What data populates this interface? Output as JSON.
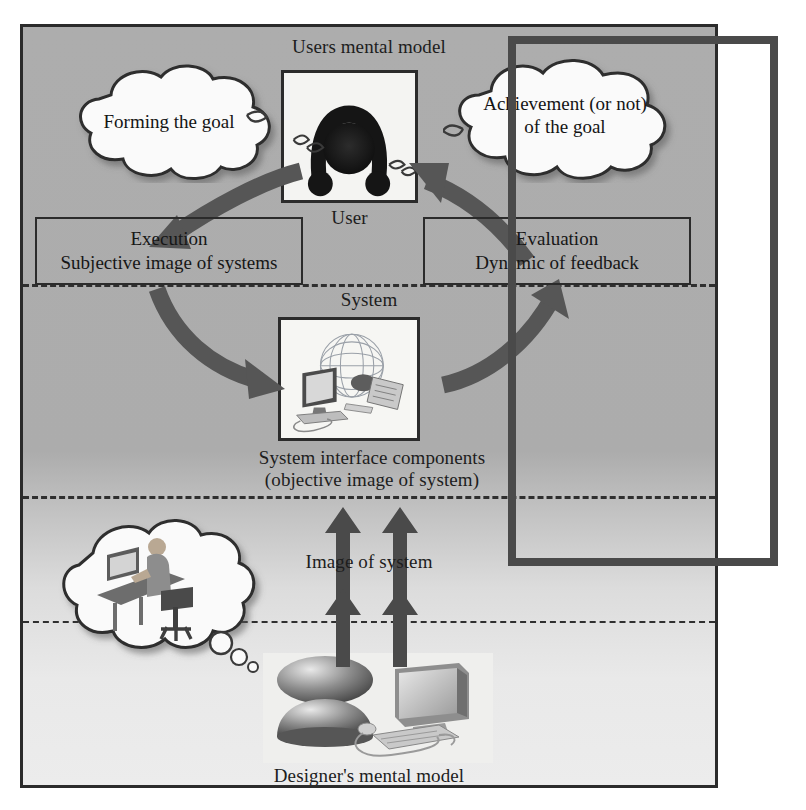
{
  "diagram": {
    "title": "Users mental model",
    "labels": {
      "users_mental_model": "Users mental model",
      "user": "User",
      "system": "System",
      "system_interface_line1": "System interface components",
      "system_interface_line2": "(objective image of system)",
      "image_of_system": "Image of system",
      "designers_mental_model": "Designer's mental model"
    },
    "clouds": [
      {
        "id": "forming-goal",
        "text": "Forming the goal"
      },
      {
        "id": "achievement-goal",
        "text": "Achievement (or not) of the goal"
      },
      {
        "id": "designer-thought",
        "text": ""
      }
    ],
    "boxes": [
      {
        "id": "execution",
        "line1": "Execution",
        "line2": "Subjective image of systems"
      },
      {
        "id": "evaluation",
        "line1": "Evaluation",
        "line2": "Dynamic of feedback"
      }
    ],
    "images": [
      {
        "id": "user-figure",
        "alt": "user-silhouette-icon"
      },
      {
        "id": "system-components",
        "alt": "globe-computer-keyboard-mouse-icon"
      },
      {
        "id": "designer-workstation",
        "alt": "person-at-desk-icon"
      },
      {
        "id": "designer-equipment",
        "alt": "mouse-monitor-keyboard-icon"
      }
    ],
    "arrows": [
      {
        "id": "user-to-execution",
        "type": "curved",
        "direction": "down-left"
      },
      {
        "id": "evaluation-to-user",
        "type": "curved",
        "direction": "up-right"
      },
      {
        "id": "execution-to-system",
        "type": "curved",
        "direction": "down-right"
      },
      {
        "id": "system-to-evaluation",
        "type": "curved",
        "direction": "up-right"
      },
      {
        "id": "image-of-system-up-left-lower",
        "type": "straight",
        "direction": "up"
      },
      {
        "id": "image-of-system-up-right-lower",
        "type": "straight",
        "direction": "up"
      },
      {
        "id": "image-of-system-up-left-upper",
        "type": "straight",
        "direction": "up"
      },
      {
        "id": "image-of-system-up-right-upper",
        "type": "straight",
        "direction": "up"
      }
    ],
    "colors": {
      "panel_fill": "#adadad",
      "panel_border": "#2b2b2b",
      "arrow_fill": "#565656",
      "text": "#1a1a1a",
      "overlay_border": "#4a4a4a",
      "cloud_fill": "#fafafa"
    }
  }
}
